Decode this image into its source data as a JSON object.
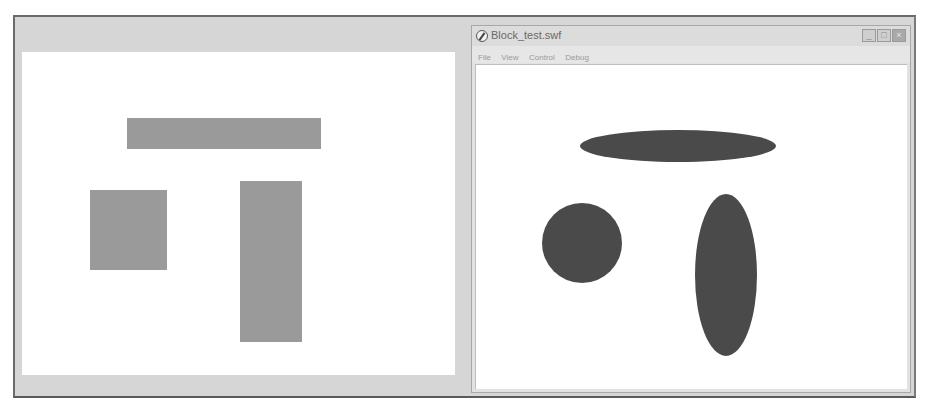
{
  "left_panel": {
    "shapes": [
      {
        "name": "horizontal-bar",
        "kind": "rect",
        "x": 127,
        "y": 118,
        "w": 194,
        "h": 31
      },
      {
        "name": "square",
        "kind": "rect",
        "x": 90,
        "y": 190,
        "w": 77,
        "h": 80
      },
      {
        "name": "vertical-bar",
        "kind": "rect",
        "x": 240,
        "y": 181,
        "w": 62,
        "h": 161
      }
    ],
    "fill_color": "#9a9a9a"
  },
  "player_window": {
    "title": "Block_test.swf",
    "controls": {
      "minimize": "_",
      "maximize": "□",
      "close": "×"
    },
    "menu": [
      "File",
      "View",
      "Control",
      "Debug"
    ],
    "shapes": [
      {
        "name": "horizontal-ellipse",
        "kind": "ellipse",
        "cx": 678,
        "cy": 146,
        "rx": 98,
        "ry": 16
      },
      {
        "name": "circle",
        "kind": "ellipse",
        "cx": 582,
        "cy": 243,
        "rx": 40,
        "ry": 40
      },
      {
        "name": "vertical-ellipse",
        "kind": "ellipse",
        "cx": 726,
        "cy": 275,
        "rx": 31,
        "ry": 81
      }
    ],
    "fill_color": "#4a4a4a"
  }
}
